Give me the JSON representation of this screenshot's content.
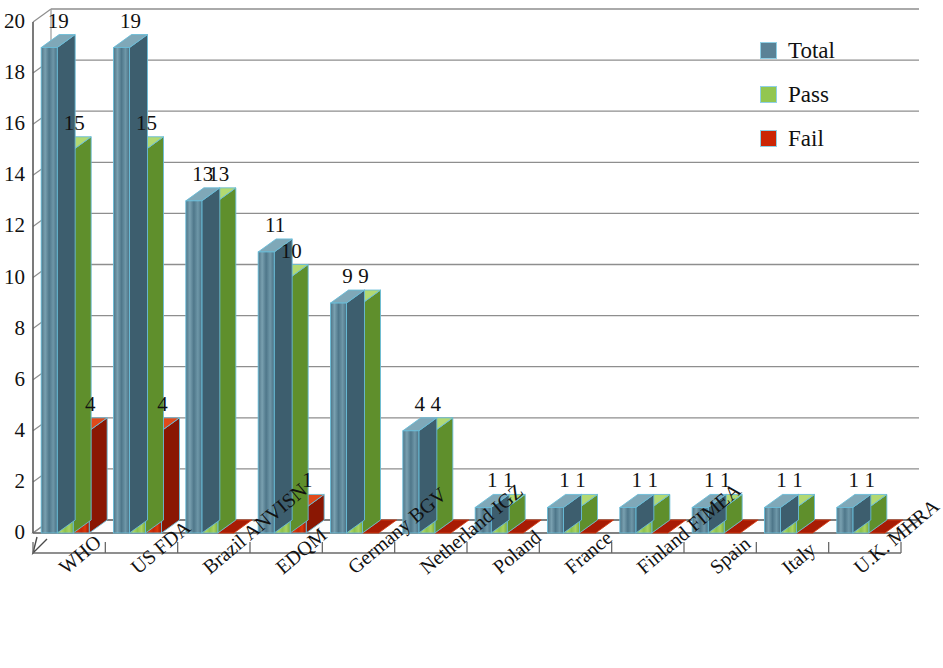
{
  "chart_data": {
    "type": "bar",
    "title": "",
    "xlabel": "",
    "ylabel": "",
    "ylim": [
      0,
      20
    ],
    "ytick_step": 2,
    "yticks": [
      "0",
      "2",
      "4",
      "6",
      "8",
      "10",
      "12",
      "14",
      "16",
      "18",
      "20"
    ],
    "grid": true,
    "legend_position": "top-right",
    "three_d": true,
    "categories": [
      "WHO",
      "US FDA",
      "Brazil ANVISN",
      "EDQM",
      "Germany BGV",
      "Netherland IGZ",
      "Poland",
      "France",
      "Finland FIMEA",
      "Spain",
      "Italy",
      "U.K. MHRA"
    ],
    "series": [
      {
        "name": "Total",
        "color": "#5a8296",
        "values": [
          19,
          19,
          13,
          11,
          9,
          4,
          1,
          1,
          1,
          1,
          1,
          1
        ],
        "labels": [
          "19",
          "19",
          "13",
          "11",
          "9",
          "4",
          "1",
          "1",
          "1",
          "1",
          "1",
          "1"
        ]
      },
      {
        "name": "Pass",
        "color": "#92c651",
        "values": [
          15,
          15,
          13,
          10,
          9,
          4,
          1,
          1,
          1,
          1,
          1,
          1
        ],
        "labels": [
          "15",
          "15",
          "13",
          "10",
          "9",
          "4",
          "1",
          "1",
          "1",
          "1",
          "1",
          "1"
        ]
      },
      {
        "name": "Fail",
        "color": "#cc2606",
        "values": [
          4,
          4,
          0,
          1,
          0,
          0,
          0,
          0,
          0,
          0,
          0,
          0
        ],
        "labels": [
          "4",
          "4",
          "",
          "1",
          "",
          "",
          "",
          "",
          "",
          "",
          "",
          ""
        ]
      }
    ]
  },
  "legend": {
    "items": [
      {
        "label": "Total",
        "color": "#5a8296"
      },
      {
        "label": "Pass",
        "color": "#92c651"
      },
      {
        "label": "Fail",
        "color": "#cc2606"
      }
    ]
  }
}
